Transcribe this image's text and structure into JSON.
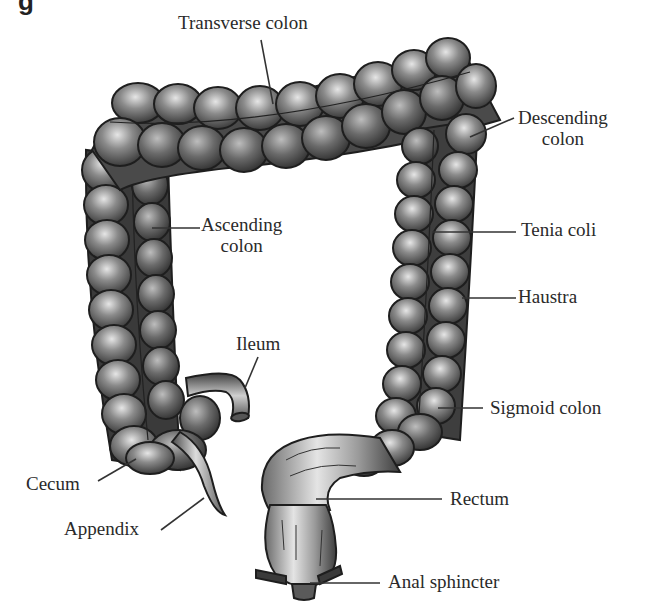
{
  "figure": {
    "corner_fragment": "g",
    "style": "grayscale shaded line drawing",
    "colors": {
      "background": "#ffffff",
      "outline": "#1e1e1e",
      "shade_dark": "#3a3a3a",
      "shade_mid": "#7a7a7a",
      "shade_light": "#d8d8d8",
      "label_text": "#2a2a2a",
      "leader_line": "#333333"
    }
  },
  "labels": {
    "transverse_colon": {
      "line1": "Transverse colon"
    },
    "descending_colon": {
      "line1": "Descending",
      "line2": "colon"
    },
    "ascending_colon": {
      "line1": "Ascending",
      "line2": "colon"
    },
    "tenia_coli": {
      "line1": "Tenia coli"
    },
    "haustra": {
      "line1": "Haustra"
    },
    "ileum": {
      "line1": "Ileum"
    },
    "sigmoid_colon": {
      "line1": "Sigmoid colon"
    },
    "cecum": {
      "line1": "Cecum"
    },
    "rectum": {
      "line1": "Rectum"
    },
    "appendix": {
      "line1": "Appendix"
    },
    "anal_sphincter": {
      "line1": "Anal sphincter"
    }
  }
}
